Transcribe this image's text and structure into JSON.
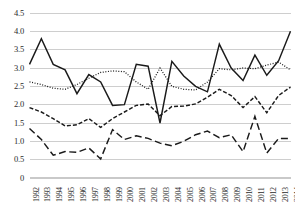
{
  "chart_data": {
    "type": "line",
    "title": "",
    "subtitle": "",
    "xlabel": "",
    "ylabel": "",
    "grid": true,
    "legend_position": "none",
    "ylim": [
      0,
      4.5
    ],
    "ytick_labels": [
      "0",
      "0.5",
      "1.0",
      "1.5",
      "2.0",
      "2.5",
      "3.0",
      "3.5",
      "4.0",
      "4.5"
    ],
    "ytick_values": [
      0,
      0.5,
      1.0,
      1.5,
      2.0,
      2.5,
      3.0,
      3.5,
      4.0,
      4.5
    ],
    "categories": [
      "1992",
      "1993",
      "1994",
      "1995",
      "1996",
      "1997",
      "1998",
      "1999",
      "2000",
      "2001",
      "2002",
      "2003",
      "2004",
      "2005",
      "2006",
      "2007",
      "2008",
      "2009",
      "2010",
      "2011",
      "2012",
      "2013",
      "2014"
    ],
    "x": [
      1992,
      1993,
      1994,
      1995,
      1996,
      1997,
      1998,
      1999,
      2000,
      2001,
      2002,
      2003,
      2004,
      2005,
      2006,
      2007,
      2008,
      2009,
      2010,
      2011,
      2012,
      2013,
      2014
    ],
    "series": [
      {
        "name": "series-1-solid",
        "style": "solid",
        "color": "#1a1a1a",
        "values": [
          3.1,
          3.8,
          3.1,
          2.95,
          2.3,
          2.82,
          2.62,
          1.98,
          2.0,
          3.1,
          3.05,
          1.5,
          3.18,
          2.78,
          2.5,
          2.35,
          3.65,
          3.0,
          2.66,
          3.35,
          2.8,
          3.2,
          4.0
        ]
      },
      {
        "name": "series-2-dotted",
        "style": "dotted",
        "color": "#1a1a1a",
        "values": [
          2.62,
          2.55,
          2.45,
          2.42,
          2.55,
          2.72,
          2.88,
          2.92,
          2.9,
          2.62,
          2.42,
          3.0,
          2.5,
          2.42,
          2.4,
          2.62,
          2.98,
          2.95,
          3.0,
          2.98,
          3.08,
          3.16,
          2.95
        ]
      },
      {
        "name": "series-3-dashed",
        "style": "dashed",
        "color": "#1a1a1a",
        "values": [
          1.92,
          1.8,
          1.62,
          1.42,
          1.45,
          1.62,
          1.38,
          1.62,
          1.8,
          1.98,
          2.02,
          1.7,
          1.95,
          1.96,
          2.02,
          2.2,
          2.42,
          2.25,
          1.92,
          2.22,
          1.78,
          2.25,
          2.48
        ]
      },
      {
        "name": "series-4-long-dashed",
        "style": "long-dashed",
        "color": "#1a1a1a",
        "values": [
          1.35,
          1.05,
          0.62,
          0.72,
          0.7,
          0.82,
          0.52,
          1.32,
          1.05,
          1.15,
          1.08,
          0.95,
          0.88,
          1.0,
          1.18,
          1.28,
          1.1,
          1.18,
          0.72,
          1.68,
          0.68,
          1.08,
          1.08
        ]
      }
    ]
  },
  "axes": {
    "y_axis_name": "value-axis",
    "x_axis_name": "year-axis"
  }
}
